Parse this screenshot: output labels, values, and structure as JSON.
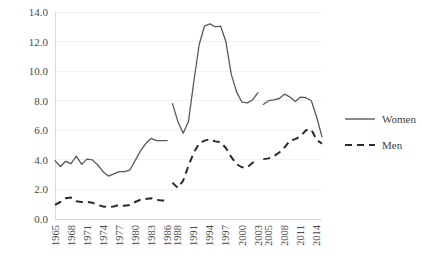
{
  "chart_data": {
    "type": "line",
    "title": "",
    "xlabel": "",
    "ylabel": "",
    "ylim": [
      0.0,
      14.0
    ],
    "ytick_values": [
      0.0,
      2.0,
      4.0,
      6.0,
      8.0,
      10.0,
      12.0,
      14.0
    ],
    "ytick_labels": [
      "0.0",
      "2.0",
      "4.0",
      "6.0",
      "8.0",
      "10.0",
      "12.0",
      "14.0"
    ],
    "xtick_labels": [
      "1965",
      "1968",
      "1971",
      "1974",
      "1977",
      "1980",
      "1983",
      "1986",
      "1988",
      "1991",
      "1994",
      "1997",
      "2000",
      "2003",
      "2005",
      "2008",
      "2011",
      "2014"
    ],
    "grid": "horizontal",
    "legend_position": "right",
    "legend": [
      "Women",
      "Men"
    ],
    "colors": {
      "women": "#595959",
      "men": "#2b2b2b",
      "gridline": "#f2f2f2",
      "axis": "#d9d9d9",
      "text": "#4a4a4a"
    },
    "x": [
      1965,
      1966,
      1967,
      1968,
      1969,
      1970,
      1971,
      1972,
      1973,
      1974,
      1975,
      1976,
      1977,
      1978,
      1979,
      1980,
      1981,
      1982,
      1983,
      1984,
      1985,
      1986,
      1987,
      1988,
      1989,
      1990,
      1991,
      1992,
      1993,
      1994,
      1995,
      1996,
      1997,
      1998,
      1999,
      2000,
      2001,
      2002,
      2003,
      2004,
      2005,
      2006,
      2007,
      2008,
      2009,
      2010,
      2011,
      2012,
      2013,
      2014,
      2015
    ],
    "series": [
      {
        "name": "Women",
        "style": "solid",
        "segments": [
          {
            "x": [
              1965,
              1966,
              1967,
              1968,
              1969,
              1970,
              1971,
              1972,
              1973,
              1974,
              1975,
              1976,
              1977,
              1978,
              1979,
              1980,
              1981,
              1982,
              1983,
              1984,
              1985,
              1986
            ],
            "values": [
              3.95,
              3.55,
              3.9,
              3.75,
              4.25,
              3.7,
              4.05,
              4.0,
              3.65,
              3.2,
              2.9,
              3.05,
              3.2,
              3.2,
              3.3,
              3.95,
              4.6,
              5.1,
              5.45,
              5.3,
              5.3,
              5.3
            ]
          },
          {
            "x": [
              1987,
              1988,
              1989,
              1990,
              1991,
              1992,
              1993,
              1994,
              1995,
              1996,
              1997,
              1998,
              1999,
              2000,
              2001,
              2002,
              2003
            ],
            "values": [
              7.8,
              6.6,
              5.8,
              6.6,
              9.3,
              11.8,
              13.05,
              13.2,
              13.0,
              13.05,
              12.0,
              9.8,
              8.6,
              7.9,
              7.85,
              8.05,
              8.55
            ]
          },
          {
            "x": [
              2004,
              2005,
              2006,
              2007,
              2008,
              2009,
              2010,
              2011,
              2012,
              2013,
              2014,
              2015
            ],
            "values": [
              7.75,
              8.0,
              8.05,
              8.15,
              8.45,
              8.25,
              7.95,
              8.25,
              8.2,
              8.0,
              6.9,
              5.55
            ]
          }
        ]
      },
      {
        "name": "Men",
        "style": "dashed",
        "segments": [
          {
            "x": [
              1965,
              1966,
              1967,
              1968,
              1969,
              1970,
              1971,
              1972,
              1973,
              1974,
              1975,
              1976,
              1977,
              1978,
              1979,
              1980,
              1981,
              1982,
              1983,
              1984,
              1985,
              1986
            ],
            "values": [
              0.95,
              1.15,
              1.4,
              1.45,
              1.2,
              1.15,
              1.15,
              1.1,
              0.95,
              0.85,
              0.8,
              0.85,
              0.95,
              0.9,
              0.95,
              1.15,
              1.3,
              1.35,
              1.4,
              1.3,
              1.25,
              1.25
            ]
          },
          {
            "x": [
              1987,
              1988,
              1989,
              1990,
              1991,
              1992,
              1993,
              1994,
              1995,
              1996,
              1997,
              1998,
              1999,
              2000,
              2001,
              2002,
              2003
            ],
            "values": [
              2.45,
              2.1,
              2.6,
              3.6,
              4.5,
              5.1,
              5.3,
              5.4,
              5.25,
              5.2,
              4.8,
              4.2,
              3.7,
              3.5,
              3.5,
              3.8,
              4.0
            ]
          },
          {
            "x": [
              2004,
              2005,
              2006,
              2007,
              2008,
              2009,
              2010,
              2011,
              2012,
              2013,
              2014,
              2015
            ],
            "values": [
              4.05,
              4.1,
              4.25,
              4.5,
              4.85,
              5.3,
              5.4,
              5.6,
              6.0,
              6.05,
              5.35,
              5.1
            ]
          }
        ]
      }
    ]
  }
}
